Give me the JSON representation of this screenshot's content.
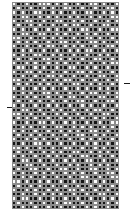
{
  "figure": {
    "title": "",
    "background_color": "#ffffff",
    "width": 135,
    "height": 211
  },
  "plot_area": {
    "x": 12,
    "y": 2,
    "width": 107,
    "height": 207,
    "columns": 25,
    "rows": 49,
    "cell_border_color": "#8c8c8c"
  },
  "ticks": {
    "left": {
      "x": 7,
      "y": 107,
      "width": 5,
      "height": 1,
      "label": ""
    },
    "right": {
      "x": 124,
      "y": 83,
      "width": 6,
      "height": 1,
      "label": ""
    }
  },
  "chart_data": {
    "type": "heatmap",
    "title": "",
    "subtitle": "",
    "xlabel": "",
    "ylabel": "",
    "legend": [],
    "grid": true,
    "colormap": {
      "0": "#fdfdfd",
      "1": "#141414"
    },
    "value_labels": {
      "0": "off",
      "1": "on"
    },
    "x_tick_labels": [],
    "y_tick_labels": [],
    "ncols": 25,
    "nrows": 49,
    "values": [
      [
        0,
        1,
        1,
        0,
        1,
        1,
        0,
        0,
        0,
        1,
        0,
        1,
        0,
        1,
        1,
        0,
        1,
        1,
        0,
        0,
        1,
        0,
        1,
        1,
        0
      ],
      [
        1,
        0,
        1,
        1,
        0,
        1,
        1,
        0,
        1,
        0,
        1,
        1,
        0,
        0,
        1,
        1,
        0,
        1,
        1,
        0,
        1,
        1,
        0,
        0,
        1
      ],
      [
        0,
        1,
        0,
        1,
        1,
        0,
        0,
        1,
        1,
        0,
        1,
        0,
        1,
        1,
        0,
        1,
        1,
        0,
        0,
        1,
        1,
        0,
        1,
        0,
        1
      ],
      [
        1,
        1,
        0,
        0,
        1,
        1,
        0,
        1,
        0,
        1,
        0,
        1,
        1,
        0,
        1,
        0,
        1,
        1,
        0,
        1,
        0,
        1,
        1,
        0,
        0
      ],
      [
        0,
        1,
        1,
        0,
        0,
        1,
        1,
        0,
        1,
        1,
        0,
        0,
        1,
        1,
        0,
        1,
        0,
        1,
        1,
        0,
        1,
        1,
        0,
        1,
        0
      ],
      [
        1,
        0,
        1,
        1,
        0,
        1,
        0,
        1,
        1,
        0,
        1,
        1,
        0,
        1,
        0,
        0,
        1,
        1,
        0,
        1,
        1,
        0,
        0,
        1,
        1
      ],
      [
        0,
        1,
        0,
        1,
        1,
        0,
        1,
        1,
        0,
        1,
        0,
        1,
        1,
        0,
        1,
        1,
        0,
        0,
        1,
        1,
        0,
        1,
        1,
        0,
        0
      ],
      [
        1,
        1,
        0,
        0,
        1,
        1,
        0,
        0,
        1,
        1,
        0,
        1,
        0,
        1,
        1,
        0,
        1,
        0,
        1,
        0,
        1,
        1,
        0,
        1,
        1
      ],
      [
        0,
        0,
        1,
        1,
        0,
        1,
        1,
        0,
        1,
        0,
        1,
        0,
        1,
        1,
        0,
        1,
        1,
        0,
        0,
        1,
        0,
        1,
        1,
        0,
        1
      ],
      [
        1,
        0,
        1,
        0,
        1,
        0,
        1,
        1,
        0,
        1,
        1,
        0,
        0,
        1,
        1,
        0,
        1,
        1,
        0,
        0,
        1,
        0,
        1,
        1,
        0
      ],
      [
        0,
        1,
        1,
        0,
        1,
        1,
        0,
        1,
        0,
        0,
        1,
        1,
        0,
        1,
        0,
        1,
        0,
        1,
        1,
        0,
        1,
        1,
        0,
        0,
        1
      ],
      [
        1,
        1,
        0,
        1,
        0,
        1,
        1,
        0,
        1,
        1,
        0,
        1,
        1,
        0,
        1,
        0,
        1,
        0,
        0,
        1,
        1,
        0,
        1,
        1,
        0
      ],
      [
        0,
        1,
        0,
        1,
        1,
        0,
        0,
        1,
        1,
        0,
        1,
        0,
        1,
        1,
        0,
        1,
        1,
        0,
        1,
        1,
        0,
        1,
        0,
        1,
        1
      ],
      [
        1,
        0,
        1,
        1,
        0,
        1,
        1,
        0,
        0,
        1,
        1,
        0,
        1,
        0,
        1,
        1,
        0,
        1,
        1,
        0,
        0,
        1,
        1,
        0,
        1
      ],
      [
        0,
        1,
        1,
        0,
        1,
        0,
        1,
        1,
        0,
        1,
        0,
        1,
        0,
        1,
        1,
        0,
        1,
        1,
        0,
        1,
        1,
        0,
        1,
        0,
        0
      ],
      [
        1,
        0,
        0,
        1,
        1,
        0,
        1,
        0,
        1,
        1,
        0,
        1,
        1,
        0,
        0,
        1,
        1,
        0,
        1,
        0,
        1,
        1,
        0,
        1,
        1
      ],
      [
        0,
        1,
        1,
        0,
        0,
        1,
        0,
        1,
        1,
        0,
        1,
        1,
        0,
        1,
        1,
        0,
        0,
        1,
        0,
        1,
        0,
        1,
        1,
        0,
        1
      ],
      [
        1,
        1,
        0,
        1,
        1,
        0,
        1,
        1,
        0,
        0,
        1,
        0,
        1,
        1,
        0,
        1,
        1,
        0,
        1,
        1,
        0,
        0,
        1,
        1,
        0
      ],
      [
        0,
        0,
        1,
        1,
        0,
        1,
        1,
        0,
        1,
        1,
        0,
        1,
        0,
        0,
        1,
        1,
        0,
        1,
        1,
        0,
        1,
        1,
        0,
        1,
        0
      ],
      [
        1,
        0,
        1,
        0,
        1,
        1,
        0,
        1,
        0,
        1,
        1,
        0,
        1,
        1,
        0,
        0,
        1,
        1,
        0,
        1,
        0,
        1,
        1,
        0,
        1
      ],
      [
        0,
        1,
        0,
        1,
        1,
        0,
        1,
        0,
        1,
        0,
        1,
        1,
        0,
        1,
        1,
        0,
        1,
        0,
        1,
        1,
        0,
        1,
        0,
        1,
        1
      ],
      [
        1,
        1,
        0,
        1,
        0,
        1,
        1,
        0,
        0,
        1,
        0,
        1,
        1,
        0,
        1,
        1,
        0,
        1,
        0,
        0,
        1,
        1,
        0,
        1,
        0
      ],
      [
        0,
        1,
        1,
        0,
        1,
        0,
        1,
        1,
        0,
        1,
        1,
        0,
        1,
        0,
        0,
        1,
        1,
        0,
        1,
        1,
        0,
        0,
        1,
        1,
        0
      ],
      [
        1,
        0,
        1,
        1,
        0,
        1,
        0,
        1,
        1,
        0,
        1,
        1,
        0,
        1,
        1,
        0,
        0,
        1,
        1,
        0,
        1,
        1,
        0,
        0,
        1
      ],
      [
        0,
        1,
        0,
        1,
        1,
        0,
        1,
        1,
        0,
        1,
        0,
        1,
        1,
        0,
        1,
        1,
        0,
        1,
        0,
        1,
        1,
        0,
        1,
        1,
        0
      ],
      [
        1,
        1,
        0,
        0,
        1,
        1,
        0,
        1,
        1,
        0,
        1,
        0,
        1,
        1,
        0,
        1,
        1,
        0,
        1,
        0,
        0,
        1,
        1,
        0,
        1
      ],
      [
        0,
        0,
        1,
        1,
        0,
        1,
        1,
        0,
        1,
        1,
        0,
        1,
        0,
        1,
        1,
        0,
        1,
        1,
        0,
        1,
        1,
        0,
        0,
        1,
        1
      ],
      [
        1,
        0,
        1,
        0,
        1,
        0,
        1,
        1,
        0,
        1,
        1,
        0,
        1,
        0,
        1,
        1,
        0,
        1,
        1,
        0,
        1,
        0,
        1,
        1,
        0
      ],
      [
        0,
        1,
        1,
        0,
        1,
        1,
        0,
        0,
        1,
        0,
        1,
        1,
        0,
        1,
        0,
        1,
        1,
        0,
        1,
        1,
        0,
        1,
        1,
        0,
        0
      ],
      [
        1,
        1,
        0,
        1,
        0,
        1,
        1,
        0,
        1,
        1,
        0,
        0,
        1,
        1,
        0,
        1,
        0,
        1,
        0,
        1,
        1,
        0,
        1,
        0,
        1
      ],
      [
        0,
        1,
        0,
        1,
        1,
        0,
        1,
        1,
        0,
        1,
        1,
        0,
        1,
        0,
        1,
        0,
        1,
        1,
        0,
        0,
        1,
        1,
        0,
        1,
        1
      ],
      [
        1,
        0,
        1,
        1,
        0,
        1,
        0,
        1,
        1,
        0,
        1,
        1,
        0,
        1,
        1,
        0,
        0,
        1,
        1,
        0,
        1,
        0,
        1,
        1,
        0
      ],
      [
        0,
        1,
        1,
        0,
        1,
        0,
        1,
        0,
        1,
        1,
        0,
        1,
        1,
        0,
        1,
        1,
        0,
        1,
        0,
        1,
        0,
        1,
        1,
        0,
        1
      ],
      [
        1,
        1,
        0,
        1,
        1,
        0,
        0,
        1,
        0,
        1,
        1,
        0,
        1,
        1,
        0,
        1,
        1,
        0,
        1,
        0,
        1,
        1,
        0,
        1,
        0
      ],
      [
        0,
        0,
        1,
        0,
        1,
        1,
        0,
        1,
        1,
        0,
        1,
        1,
        0,
        0,
        1,
        1,
        0,
        1,
        1,
        0,
        1,
        0,
        1,
        1,
        0
      ],
      [
        1,
        0,
        1,
        1,
        0,
        1,
        1,
        0,
        1,
        0,
        1,
        0,
        1,
        1,
        0,
        0,
        1,
        1,
        0,
        1,
        0,
        1,
        0,
        1,
        1
      ],
      [
        0,
        1,
        0,
        1,
        1,
        0,
        1,
        1,
        0,
        1,
        0,
        1,
        1,
        0,
        1,
        1,
        0,
        0,
        1,
        1,
        0,
        1,
        1,
        0,
        1
      ],
      [
        1,
        1,
        0,
        0,
        1,
        1,
        0,
        1,
        1,
        0,
        1,
        1,
        0,
        1,
        0,
        1,
        1,
        0,
        0,
        1,
        1,
        0,
        1,
        1,
        0
      ],
      [
        0,
        1,
        1,
        0,
        0,
        1,
        1,
        0,
        1,
        1,
        0,
        1,
        1,
        0,
        1,
        0,
        1,
        1,
        0,
        1,
        0,
        1,
        0,
        1,
        1
      ],
      [
        1,
        0,
        1,
        1,
        0,
        0,
        1,
        1,
        0,
        1,
        1,
        0,
        0,
        1,
        1,
        0,
        1,
        1,
        0,
        0,
        1,
        1,
        0,
        1,
        0
      ],
      [
        0,
        1,
        0,
        1,
        1,
        0,
        1,
        0,
        1,
        0,
        1,
        1,
        0,
        1,
        0,
        1,
        0,
        1,
        1,
        0,
        1,
        1,
        0,
        0,
        1
      ],
      [
        1,
        1,
        0,
        1,
        0,
        1,
        1,
        0,
        1,
        1,
        0,
        1,
        1,
        0,
        1,
        1,
        0,
        0,
        1,
        1,
        0,
        1,
        1,
        0,
        0
      ],
      [
        0,
        0,
        1,
        0,
        1,
        1,
        0,
        1,
        0,
        1,
        1,
        0,
        1,
        1,
        0,
        1,
        1,
        0,
        1,
        0,
        1,
        0,
        1,
        1,
        0
      ],
      [
        1,
        0,
        1,
        1,
        0,
        1,
        0,
        1,
        1,
        0,
        1,
        1,
        0,
        1,
        1,
        0,
        1,
        1,
        0,
        1,
        0,
        1,
        1,
        0,
        1
      ],
      [
        0,
        1,
        1,
        0,
        1,
        0,
        1,
        1,
        0,
        1,
        0,
        1,
        1,
        0,
        0,
        1,
        0,
        1,
        1,
        0,
        1,
        1,
        0,
        1,
        1
      ],
      [
        1,
        1,
        0,
        1,
        1,
        0,
        1,
        0,
        1,
        0,
        1,
        0,
        1,
        1,
        0,
        1,
        1,
        0,
        1,
        1,
        0,
        0,
        1,
        1,
        0
      ],
      [
        0,
        1,
        0,
        0,
        1,
        1,
        0,
        1,
        1,
        0,
        1,
        1,
        0,
        1,
        1,
        0,
        1,
        1,
        0,
        1,
        1,
        0,
        1,
        0,
        1
      ],
      [
        1,
        0,
        1,
        1,
        0,
        1,
        1,
        0,
        1,
        1,
        0,
        1,
        0,
        0,
        1,
        1,
        0,
        1,
        1,
        0,
        1,
        1,
        0,
        1,
        0
      ],
      [
        1,
        1,
        0,
        1,
        1,
        0,
        1,
        1,
        0,
        1,
        1,
        0,
        1,
        1,
        0,
        1,
        1,
        0,
        1,
        0,
        1,
        1,
        0,
        1,
        1
      ]
    ]
  }
}
